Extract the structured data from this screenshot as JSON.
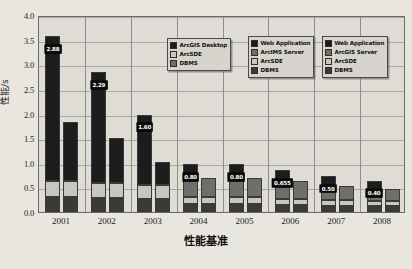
{
  "chart_data": {
    "type": "bar",
    "subtype": "stacked-grouped",
    "title": "",
    "xlabel": "性能基准",
    "ylabel": "性能/s",
    "ylim": [
      0.0,
      4.0
    ],
    "ytick_step": 0.5,
    "ytick_labels": [
      "0.0",
      "0.5",
      "1.0",
      "1.5",
      "2.0",
      "2.5",
      "3.0",
      "3.5",
      "4.0"
    ],
    "categories": [
      "2001",
      "2002",
      "2003",
      "2004",
      "2005",
      "2006",
      "2007",
      "2008"
    ],
    "grid": "horizontal-and-group-dividers",
    "legend_position": "top-right",
    "groups": [
      {
        "category": "2001",
        "bars": [
          {
            "label": "2.88",
            "total": 3.58,
            "segments": [
              {
                "name": "DBMS",
                "value": 0.3
              },
              {
                "name": "ArcSDE",
                "value": 0.32
              },
              {
                "name": "ArcGIS Desktop",
                "value": 2.96
              }
            ]
          },
          {
            "label": "",
            "total": 1.83,
            "segments": [
              {
                "name": "DBMS",
                "value": 0.3
              },
              {
                "name": "ArcSDE",
                "value": 0.33
              },
              {
                "name": "ArcGIS Desktop",
                "value": 1.2
              }
            ]
          }
        ]
      },
      {
        "category": "2002",
        "bars": [
          {
            "label": "2.29",
            "total": 2.84,
            "segments": [
              {
                "name": "DBMS",
                "value": 0.28
              },
              {
                "name": "ArcSDE",
                "value": 0.3
              },
              {
                "name": "ArcGIS Desktop",
                "value": 2.26
              }
            ]
          },
          {
            "label": "",
            "total": 1.5,
            "segments": [
              {
                "name": "DBMS",
                "value": 0.28
              },
              {
                "name": "ArcSDE",
                "value": 0.3
              },
              {
                "name": "ArcGIS Desktop",
                "value": 0.92
              }
            ]
          }
        ]
      },
      {
        "category": "2003",
        "bars": [
          {
            "label": "1.60",
            "total": 1.98,
            "segments": [
              {
                "name": "DBMS",
                "value": 0.26
              },
              {
                "name": "ArcSDE",
                "value": 0.28
              },
              {
                "name": "ArcGIS Desktop",
                "value": 1.44
              }
            ]
          },
          {
            "label": "",
            "total": 1.02,
            "segments": [
              {
                "name": "DBMS",
                "value": 0.26
              },
              {
                "name": "ArcSDE",
                "value": 0.28
              },
              {
                "name": "ArcGIS Desktop",
                "value": 0.48
              }
            ]
          }
        ]
      },
      {
        "category": "2004",
        "bars": [
          {
            "label": "0.80",
            "total": 0.98,
            "segments": [
              {
                "name": "DBMS",
                "value": 0.16
              },
              {
                "name": "ArcSDE",
                "value": 0.14
              },
              {
                "name": "ArcIMS Server",
                "value": 0.38
              },
              {
                "name": "Web Application",
                "value": 0.3
              }
            ]
          },
          {
            "label": "",
            "total": 0.7,
            "segments": [
              {
                "name": "DBMS",
                "value": 0.16
              },
              {
                "name": "ArcSDE",
                "value": 0.14
              },
              {
                "name": "ArcIMS Server",
                "value": 0.4
              }
            ]
          }
        ]
      },
      {
        "category": "2005",
        "bars": [
          {
            "label": "0.80",
            "total": 0.98,
            "segments": [
              {
                "name": "DBMS",
                "value": 0.16
              },
              {
                "name": "ArcSDE",
                "value": 0.14
              },
              {
                "name": "ArcIMS Server",
                "value": 0.38
              },
              {
                "name": "Web Application",
                "value": 0.3
              }
            ]
          },
          {
            "label": "",
            "total": 0.7,
            "segments": [
              {
                "name": "DBMS",
                "value": 0.16
              },
              {
                "name": "ArcSDE",
                "value": 0.14
              },
              {
                "name": "ArcIMS Server",
                "value": 0.4
              }
            ]
          }
        ]
      },
      {
        "category": "2006",
        "bars": [
          {
            "label": "0.655",
            "total": 0.86,
            "segments": [
              {
                "name": "DBMS",
                "value": 0.14
              },
              {
                "name": "ArcSDE",
                "value": 0.12
              },
              {
                "name": "ArcGIS Server",
                "value": 0.34
              },
              {
                "name": "Web Application",
                "value": 0.26
              }
            ]
          },
          {
            "label": "",
            "total": 0.62,
            "segments": [
              {
                "name": "DBMS",
                "value": 0.14
              },
              {
                "name": "ArcSDE",
                "value": 0.12
              },
              {
                "name": "ArcGIS Server",
                "value": 0.36
              }
            ]
          }
        ]
      },
      {
        "category": "2007",
        "bars": [
          {
            "label": "0.50",
            "total": 0.74,
            "segments": [
              {
                "name": "DBMS",
                "value": 0.13
              },
              {
                "name": "ArcSDE",
                "value": 0.11
              },
              {
                "name": "ArcGIS Server",
                "value": 0.28
              },
              {
                "name": "Web Application",
                "value": 0.22
              }
            ]
          },
          {
            "label": "",
            "total": 0.52,
            "segments": [
              {
                "name": "DBMS",
                "value": 0.13
              },
              {
                "name": "ArcSDE",
                "value": 0.11
              },
              {
                "name": "ArcGIS Server",
                "value": 0.28
              }
            ]
          }
        ]
      },
      {
        "category": "2008",
        "bars": [
          {
            "label": "0.40",
            "total": 0.64,
            "segments": [
              {
                "name": "DBMS",
                "value": 0.12
              },
              {
                "name": "ArcSDE",
                "value": 0.1
              },
              {
                "name": "ArcGIS Server",
                "value": 0.24
              },
              {
                "name": "Web Application",
                "value": 0.18
              }
            ]
          },
          {
            "label": "",
            "total": 0.46,
            "segments": [
              {
                "name": "DBMS",
                "value": 0.12
              },
              {
                "name": "ArcSDE",
                "value": 0.1
              },
              {
                "name": "ArcGIS Server",
                "value": 0.24
              }
            ]
          }
        ]
      }
    ],
    "colors": {
      "ArcGIS Desktop": "#1c1c1c",
      "Web Application": "#1c1c1c",
      "ArcIMS Server": "#6e6e6a",
      "ArcGIS Server": "#6e6e6a",
      "ArcSDE": "#c8c6be",
      "DBMS": "#3a3a38",
      "plot_background": "#dedcd4",
      "page_background": "#e8e6de",
      "axis": "#6a6a66",
      "gridline": "#a9a9a3",
      "label_background": "#111111",
      "label_text": "#ffffff"
    },
    "legends": [
      {
        "id": "legend-desktop",
        "entries": [
          {
            "label": "ArcGIS Desktop",
            "color": "#1c1c1c"
          },
          {
            "label": "ArcSDE",
            "color": "#c8c6be"
          },
          {
            "label": "DBMS",
            "color": "#6e6e6a"
          }
        ]
      },
      {
        "id": "legend-arcims",
        "entries": [
          {
            "label": "Web Application",
            "color": "#1c1c1c"
          },
          {
            "label": "ArcIMS Server",
            "color": "#6e6e6a"
          },
          {
            "label": "ArcSDE",
            "color": "#c8c6be"
          },
          {
            "label": "DBMS",
            "color": "#3a3a38"
          }
        ]
      },
      {
        "id": "legend-arcgis-server",
        "entries": [
          {
            "label": "Web Application",
            "color": "#1c1c1c"
          },
          {
            "label": "ArcGIS Server",
            "color": "#6e6e6a"
          },
          {
            "label": "ArcSDE",
            "color": "#c8c6be"
          },
          {
            "label": "DBMS",
            "color": "#3a3a38"
          }
        ]
      }
    ]
  }
}
